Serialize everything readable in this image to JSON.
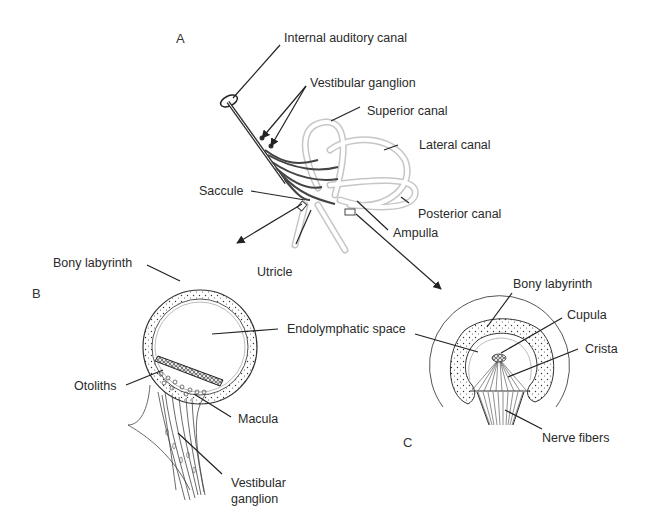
{
  "figure": {
    "panels": [
      {
        "id": "A",
        "label": "A"
      },
      {
        "id": "B",
        "label": "B"
      },
      {
        "id": "C",
        "label": "C"
      }
    ],
    "panel_a": {
      "labels": {
        "internal_auditory_canal": "Internal auditory canal",
        "vestibular_ganglion": "Vestibular ganglion",
        "superior_canal": "Superior canal",
        "lateral_canal": "Lateral canal",
        "saccule": "Saccule",
        "posterior_canal": "Posterior canal",
        "ampulla": "Ampulla",
        "utricle": "Utricle"
      }
    },
    "panel_b": {
      "labels": {
        "bony_labyrinth": "Bony labyrinth",
        "endolymphatic_space": "Endolymphatic space",
        "otoliths": "Otoliths",
        "macula": "Macula",
        "vestibular_ganglion_line1": "Vestibular",
        "vestibular_ganglion_line2": "ganglion"
      }
    },
    "panel_c": {
      "labels": {
        "bony_labyrinth": "Bony labyrinth",
        "cupula": "Cupula",
        "crista": "Crista",
        "nerve_fibers": "Nerve fibers"
      }
    },
    "colors": {
      "line": "#222222",
      "canal": "#c8c8c8",
      "text": "#2a2a2a"
    }
  }
}
